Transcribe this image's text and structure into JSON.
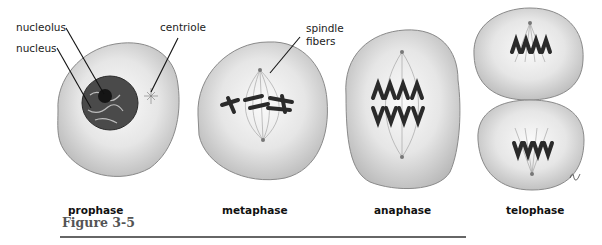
{
  "figure": {
    "caption": "Figure 3-5",
    "rule_color": "#666666"
  },
  "labels": {
    "nucleolus": "nucleolus",
    "nucleus": "nucleus",
    "centriole": "centriole",
    "spindle_line1": "spindle",
    "spindle_line2": "fibers"
  },
  "phases": [
    {
      "label": "prophase"
    },
    {
      "label": "metaphase"
    },
    {
      "label": "anaphase"
    },
    {
      "label": "telophase"
    }
  ],
  "colors": {
    "cell_fill": "#d8d8d8",
    "cell_edge": "#888888",
    "chromosome": "#2a2a2a",
    "background": "#ffffff"
  }
}
